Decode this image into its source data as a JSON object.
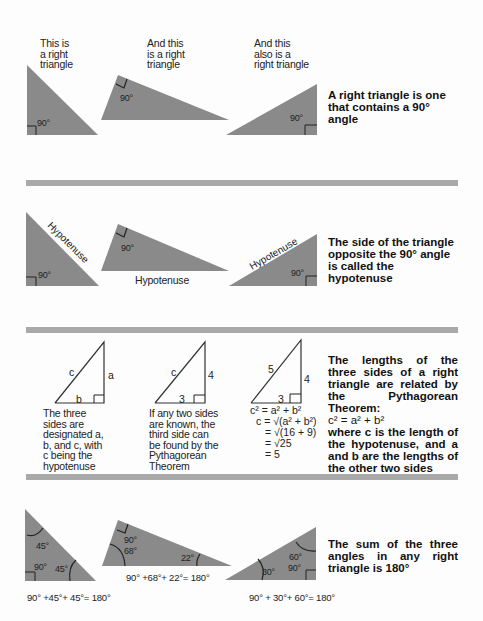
{
  "sections": [
    {
      "captions": [
        "This is\na right\ntriangle",
        "And this\nis a right\ntriangle",
        "And this\nalso is a\nright triangle"
      ],
      "angle_label": "90°",
      "description": "A right triangle is one that contains a 90° angle"
    },
    {
      "hypotenuse_label": "Hypotenuse",
      "angle_label": "90°",
      "description": "The side of the triangle opposite the 90° angle is called the hypotenuse"
    },
    {
      "triangles": [
        {
          "side_labels": {
            "c": "c",
            "a": "a",
            "b": "b"
          },
          "caption": "The three sides are designated a, b, and c, with c being the hypotenuse"
        },
        {
          "side_labels": {
            "c": "c",
            "a": "4",
            "b": "3"
          },
          "caption": "If any two sides are known, the third side can be found by the Pythagorean Theorem"
        },
        {
          "side_labels": {
            "c": "5",
            "a": "4",
            "b": "3"
          },
          "math": [
            "c² = a² + b²",
            "c = √(a² + b²)",
            "= √(16 + 9)",
            "= √25",
            "= 5"
          ]
        }
      ],
      "description_lines": [
        "The lengths of the three sides of a right triangle are related by the Pythagorean Theorem:"
      ],
      "formula": "c² = a² + b²",
      "description_after": "where c is the length of the hypotenuse, and a and b are the lengths of the other two sides"
    },
    {
      "triangles": [
        {
          "angles": [
            "45°",
            "90°",
            "45°"
          ],
          "equation": "90° +45°+ 45°= 180°"
        },
        {
          "angles": [
            "90°",
            "68°",
            "22°"
          ],
          "equation": "90° +68°+ 22°= 180°"
        },
        {
          "angles": [
            "30°",
            "60°",
            "90°"
          ],
          "equation": "90° + 30°+ 60°= 180°"
        }
      ],
      "description": "The sum of the three angles in any right triangle is 180°"
    }
  ],
  "colors": {
    "triangle_fill": "#8a8a8a",
    "bar": "#a9a9a9",
    "line": "#222222"
  }
}
